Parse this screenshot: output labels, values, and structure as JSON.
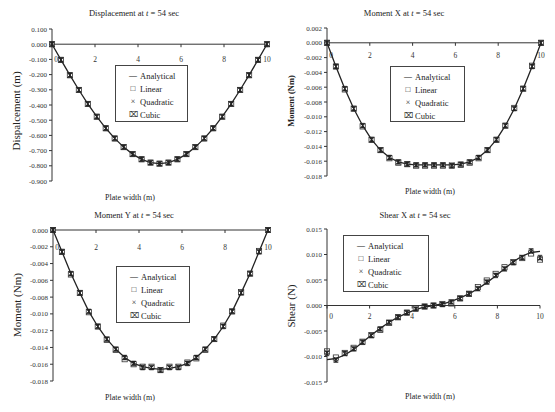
{
  "chart_data": [
    {
      "id": "displacement",
      "type": "line",
      "title": "Displacement at t = 54 sec",
      "title_parts": [
        "Displacement at ",
        "t",
        " = 54 sec"
      ],
      "xlabel": "Plate width (m)",
      "ylabel": "Dispalcement (m)",
      "xlim": [
        0,
        10
      ],
      "ylim": [
        -0.9,
        0.1
      ],
      "xticks": [
        0,
        2,
        4,
        6,
        8,
        10
      ],
      "yticks": [
        0.1,
        0.0,
        -0.1,
        -0.2,
        -0.3,
        -0.4,
        -0.5,
        -0.6,
        -0.7,
        -0.8,
        -0.9
      ],
      "ytick_labels": [
        "0.100",
        "0.000",
        "-0.100",
        "-0.200",
        "-0.300",
        "-0.400",
        "-0.500",
        "-0.600",
        "-0.700",
        "-0.800",
        "-0.900"
      ],
      "legend": [
        "Analytical",
        "Linear",
        "Quadratic",
        "Cubic"
      ],
      "x": [
        0,
        0.417,
        0.833,
        1.25,
        1.667,
        2.083,
        2.5,
        2.917,
        3.333,
        3.75,
        4.167,
        4.583,
        5.0,
        5.417,
        5.833,
        6.25,
        6.667,
        7.083,
        7.5,
        7.917,
        8.333,
        8.75,
        9.167,
        9.583,
        10
      ],
      "series": [
        {
          "name": "Analytical",
          "values": [
            0,
            -0.103,
            -0.204,
            -0.301,
            -0.393,
            -0.477,
            -0.553,
            -0.62,
            -0.677,
            -0.723,
            -0.757,
            -0.779,
            -0.786,
            -0.779,
            -0.757,
            -0.723,
            -0.677,
            -0.62,
            -0.553,
            -0.477,
            -0.393,
            -0.301,
            -0.204,
            -0.103,
            0
          ]
        },
        {
          "name": "Linear",
          "values": [
            0,
            -0.103,
            -0.204,
            -0.301,
            -0.393,
            -0.477,
            -0.553,
            -0.62,
            -0.677,
            -0.723,
            -0.757,
            -0.779,
            -0.786,
            -0.779,
            -0.757,
            -0.723,
            -0.677,
            -0.62,
            -0.553,
            -0.477,
            -0.393,
            -0.301,
            -0.204,
            -0.103,
            0
          ]
        },
        {
          "name": "Quadratic",
          "values": [
            0,
            -0.103,
            -0.204,
            -0.301,
            -0.393,
            -0.477,
            -0.553,
            -0.62,
            -0.677,
            -0.723,
            -0.757,
            -0.779,
            -0.786,
            -0.779,
            -0.757,
            -0.723,
            -0.677,
            -0.62,
            -0.553,
            -0.477,
            -0.393,
            -0.301,
            -0.204,
            -0.103,
            0
          ]
        },
        {
          "name": "Cubic",
          "values": [
            0,
            -0.103,
            -0.204,
            -0.301,
            -0.393,
            -0.477,
            -0.553,
            -0.62,
            -0.677,
            -0.723,
            -0.757,
            -0.779,
            -0.786,
            -0.779,
            -0.757,
            -0.723,
            -0.677,
            -0.62,
            -0.553,
            -0.477,
            -0.393,
            -0.301,
            -0.204,
            -0.103,
            0
          ]
        }
      ],
      "legend_position": "center"
    },
    {
      "id": "moment-x",
      "type": "line",
      "title": "Moment X at t = 54 sec",
      "title_parts": [
        "Moment X at ",
        "t",
        " = 54 sec"
      ],
      "xlabel": "Plate width (m)",
      "ylabel": "Moment (Nm)",
      "xlim": [
        0,
        10
      ],
      "ylim": [
        -0.018,
        0.002
      ],
      "xticks": [
        0,
        2,
        4,
        6,
        8,
        10
      ],
      "yticks": [
        0.002,
        0.0,
        -0.002,
        -0.004,
        -0.006,
        -0.008,
        -0.01,
        -0.012,
        -0.014,
        -0.016,
        -0.018
      ],
      "ytick_labels": [
        "0.002",
        "0.000",
        "-0.002",
        "-0.004",
        "-0.006",
        "-0.008",
        "-0.010",
        "-0.012",
        "-0.014",
        "-0.016",
        "-0.018"
      ],
      "legend": [
        "Analytical",
        "Linear",
        "Quadratic",
        "Cubic"
      ],
      "x": [
        0,
        0.417,
        0.833,
        1.25,
        1.667,
        2.083,
        2.5,
        2.917,
        3.333,
        3.75,
        4.167,
        4.583,
        5.0,
        5.417,
        5.833,
        6.25,
        6.667,
        7.083,
        7.5,
        7.917,
        8.333,
        8.75,
        9.167,
        9.583,
        10
      ],
      "series": [
        {
          "name": "Analytical",
          "values": [
            0,
            -0.0032,
            -0.0062,
            -0.0089,
            -0.0112,
            -0.0131,
            -0.0145,
            -0.0155,
            -0.0161,
            -0.0164,
            -0.0165,
            -0.0165,
            -0.0165,
            -0.0165,
            -0.0165,
            -0.0164,
            -0.0161,
            -0.0155,
            -0.0145,
            -0.0131,
            -0.0112,
            -0.0089,
            -0.0062,
            -0.0032,
            0
          ]
        },
        {
          "name": "Linear",
          "values": [
            0,
            -0.0032,
            -0.0063,
            -0.0089,
            -0.0113,
            -0.0131,
            -0.0145,
            -0.0156,
            -0.0162,
            -0.0164,
            -0.0166,
            -0.0166,
            -0.0166,
            -0.0166,
            -0.0166,
            -0.0165,
            -0.0162,
            -0.0156,
            -0.0145,
            -0.0131,
            -0.0112,
            -0.0088,
            -0.0062,
            -0.0031,
            0
          ]
        },
        {
          "name": "Quadratic",
          "values": [
            0,
            -0.0032,
            -0.0062,
            -0.0089,
            -0.0112,
            -0.0131,
            -0.0145,
            -0.0155,
            -0.0161,
            -0.0164,
            -0.0165,
            -0.0165,
            -0.0165,
            -0.0165,
            -0.0165,
            -0.0164,
            -0.0161,
            -0.0155,
            -0.0145,
            -0.0131,
            -0.0112,
            -0.0089,
            -0.0062,
            -0.0032,
            0
          ]
        },
        {
          "name": "Cubic",
          "values": [
            0,
            -0.0032,
            -0.0062,
            -0.0089,
            -0.0112,
            -0.0131,
            -0.0145,
            -0.0155,
            -0.0161,
            -0.0164,
            -0.0165,
            -0.0165,
            -0.0165,
            -0.0165,
            -0.0166,
            -0.0164,
            -0.0161,
            -0.0155,
            -0.0145,
            -0.0131,
            -0.0112,
            -0.0089,
            -0.0062,
            -0.0032,
            0
          ]
        }
      ],
      "legend_position": "center"
    },
    {
      "id": "moment-y",
      "type": "line",
      "title": "Moment Y at t = 54 sec",
      "title_parts": [
        "Moment Y at ",
        "t",
        " = 54 sec"
      ],
      "xlabel": "Plate width (m)",
      "ylabel": "Moment (Nm)",
      "xlim": [
        0,
        10
      ],
      "ylim": [
        -0.018,
        0.0
      ],
      "xticks": [
        0,
        2,
        4,
        6,
        8,
        10
      ],
      "yticks": [
        0.0,
        -0.002,
        -0.004,
        -0.006,
        -0.008,
        -0.01,
        -0.012,
        -0.014,
        -0.016,
        -0.018
      ],
      "ytick_labels": [
        "0.000",
        "-0.002",
        "-0.004",
        "-0.006",
        "-0.008",
        "-0.010",
        "-0.012",
        "-0.014",
        "-0.016",
        "-0.018"
      ],
      "legend": [
        "Analytical",
        "Linear",
        "Quadratic",
        "Cubic"
      ],
      "x": [
        0,
        0.417,
        0.833,
        1.25,
        1.667,
        2.083,
        2.5,
        2.917,
        3.333,
        3.75,
        4.167,
        4.583,
        5.0,
        5.417,
        5.833,
        6.25,
        6.667,
        7.083,
        7.5,
        7.917,
        8.333,
        8.75,
        9.167,
        9.583,
        10
      ],
      "series": [
        {
          "name": "Analytical",
          "values": [
            0,
            -0.0026,
            -0.0052,
            -0.0075,
            -0.0097,
            -0.0115,
            -0.013,
            -0.0142,
            -0.0152,
            -0.0159,
            -0.0163,
            -0.0165,
            -0.0166,
            -0.0165,
            -0.0163,
            -0.0159,
            -0.0152,
            -0.0142,
            -0.013,
            -0.0115,
            -0.0097,
            -0.0075,
            -0.0052,
            -0.0026,
            0
          ]
        },
        {
          "name": "Linear",
          "values": [
            0,
            -0.0026,
            -0.0053,
            -0.0075,
            -0.0098,
            -0.0115,
            -0.0131,
            -0.0143,
            -0.0154,
            -0.016,
            -0.0163,
            -0.0163,
            -0.0167,
            -0.0163,
            -0.0163,
            -0.0158,
            -0.0153,
            -0.0143,
            -0.013,
            -0.0114,
            -0.0097,
            -0.0074,
            -0.0052,
            -0.0025,
            0
          ]
        },
        {
          "name": "Quadratic",
          "values": [
            0,
            -0.0026,
            -0.0052,
            -0.0075,
            -0.0097,
            -0.0115,
            -0.013,
            -0.0142,
            -0.0152,
            -0.0159,
            -0.0163,
            -0.0164,
            -0.0166,
            -0.0164,
            -0.0163,
            -0.0159,
            -0.0152,
            -0.0142,
            -0.013,
            -0.0115,
            -0.0097,
            -0.0075,
            -0.0052,
            -0.0026,
            0
          ]
        },
        {
          "name": "Cubic",
          "values": [
            0,
            -0.0026,
            -0.0052,
            -0.0075,
            -0.0097,
            -0.0115,
            -0.013,
            -0.0142,
            -0.0152,
            -0.0159,
            -0.0164,
            -0.0164,
            -0.0167,
            -0.0164,
            -0.0164,
            -0.0159,
            -0.0152,
            -0.0142,
            -0.013,
            -0.0115,
            -0.0097,
            -0.0075,
            -0.0052,
            -0.0026,
            0
          ]
        }
      ],
      "legend_position": "center"
    },
    {
      "id": "shear-x",
      "type": "line",
      "title": "Shear X at t = 54 sec",
      "title_parts": [
        "Shear X at ",
        "t",
        " = 54 sec"
      ],
      "xlabel": "Plate width (m)",
      "ylabel": "Shear (N)",
      "xlim": [
        0,
        10
      ],
      "ylim": [
        -0.015,
        0.015
      ],
      "xticks": [
        0,
        2,
        4,
        6,
        8,
        10
      ],
      "yticks": [
        0.015,
        0.01,
        0.005,
        0.0,
        -0.005,
        -0.01,
        -0.015
      ],
      "ytick_labels": [
        "0.015",
        "0.010",
        "0.005",
        "0.000",
        "-0.005",
        "-0.010",
        "-0.015"
      ],
      "legend": [
        "Analytical",
        "Linear",
        "Quadratic",
        "Cubic"
      ],
      "x": [
        0,
        0.417,
        0.833,
        1.25,
        1.667,
        2.083,
        2.5,
        2.917,
        3.333,
        3.75,
        4.167,
        4.583,
        5.0,
        5.417,
        5.833,
        6.25,
        6.667,
        7.083,
        7.5,
        7.917,
        8.333,
        8.75,
        9.167,
        9.583,
        10
      ],
      "series": [
        {
          "name": "Analytical",
          "values": [
            -0.0106,
            -0.0104,
            -0.0097,
            -0.0086,
            -0.0072,
            -0.0058,
            -0.0045,
            -0.0033,
            -0.0023,
            -0.0015,
            -0.0008,
            -0.0003,
            0.0,
            0.0003,
            0.0008,
            0.0015,
            0.0023,
            0.0033,
            0.0045,
            0.0058,
            0.0072,
            0.0086,
            0.0097,
            0.0104,
            0.0106
          ]
        },
        {
          "name": "Linear",
          "values": [
            -0.009,
            -0.0102,
            -0.0093,
            -0.0083,
            -0.0071,
            -0.0058,
            -0.0048,
            -0.0034,
            -0.0023,
            -0.0014,
            -0.0005,
            -0.0002,
            0.0,
            0.0003,
            0.0004,
            0.0014,
            0.0023,
            0.0036,
            0.0049,
            0.0062,
            0.0075,
            0.0085,
            0.0093,
            0.0102,
            0.009
          ]
        },
        {
          "name": "Quadratic",
          "values": [
            -0.0092,
            -0.0105,
            -0.0095,
            -0.0085,
            -0.0072,
            -0.0059,
            -0.0046,
            -0.0033,
            -0.0023,
            -0.0014,
            -0.0007,
            -0.0002,
            0.0,
            0.0002,
            0.0007,
            0.0014,
            0.0023,
            0.0033,
            0.0046,
            0.0059,
            0.0072,
            0.0085,
            0.0095,
            0.0105,
            0.0092
          ]
        },
        {
          "name": "Cubic",
          "values": [
            -0.0094,
            -0.0107,
            -0.0094,
            -0.0085,
            -0.0072,
            -0.0059,
            -0.0046,
            -0.0033,
            -0.0023,
            -0.0014,
            -0.0007,
            -0.0002,
            0.0,
            0.0002,
            0.0007,
            0.0014,
            0.0023,
            0.0033,
            0.0046,
            0.0059,
            0.0072,
            0.0084,
            0.0094,
            0.0107,
            0.0094
          ]
        }
      ],
      "legend_position": "upper left"
    }
  ],
  "layout": [
    {
      "axis": {
        "x0": 52,
        "x1": 267,
        "y_top": 29,
        "y_bottom": 181
      },
      "title_pos": [
        134,
        13
      ],
      "xlabel_pos": [
        130,
        198
      ],
      "ylabel_pos": [
        16,
        111
      ],
      "ylabel_size": 11,
      "legend_box": [
        115,
        65,
        73,
        57
      ],
      "xtick_label_y": 62
    },
    {
      "axis": {
        "x0": 327,
        "x1": 541,
        "y_top": 28,
        "y_bottom": 176
      },
      "title_pos": [
        404,
        13
      ],
      "xlabel_pos": [
        430,
        192
      ],
      "ylabel_pos": [
        291,
        101
      ],
      "ylabel_size": 8.5,
      "legend_box": [
        390,
        66,
        75,
        56
      ],
      "xtick_label_y": 58
    },
    {
      "axis": {
        "x0": 53,
        "x1": 268,
        "y_top": 230,
        "y_bottom": 381
      },
      "title_pos": [
        134,
        215
      ],
      "xlabel_pos": [
        130,
        398
      ],
      "ylabel_pos": [
        17,
        305
      ],
      "ylabel_size": 11,
      "legend_box": [
        116,
        266,
        74,
        57
      ],
      "xtick_label_y": 250
    },
    {
      "axis": {
        "x0": 327,
        "x1": 540,
        "y_top": 229,
        "y_bottom": 382
      },
      "title_pos": [
        415,
        215
      ],
      "xlabel_pos": [
        430,
        397
      ],
      "ylabel_pos": [
        291,
        306
      ],
      "ylabel_size": 11,
      "legend_box": [
        343,
        235,
        86,
        57
      ],
      "xtick_label_y": 319
    }
  ]
}
